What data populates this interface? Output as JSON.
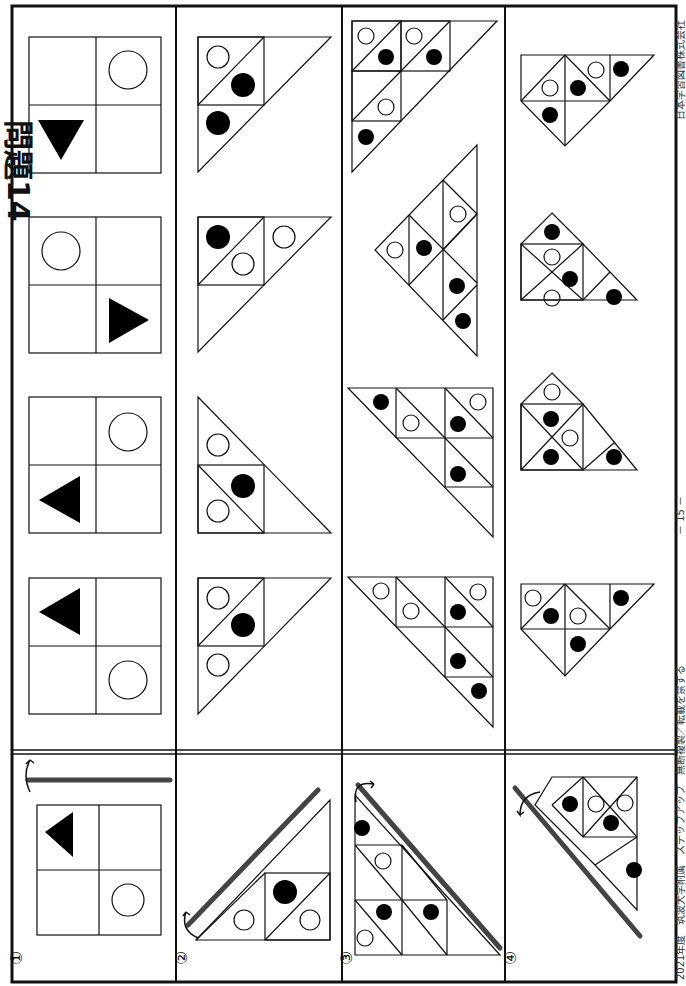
{
  "page": {
    "title": "問題14",
    "page_number": "－ 15 －",
    "footer_left": "2021年度　筑波大学附属　ステップアップ　無断複製／転載を禁ずる",
    "footer_right": "日本学習図書株式会社"
  },
  "questions": [
    {
      "number": "①",
      "type": "square-grid-flip",
      "fold_line": "horizontal bar above figure, flip arrow",
      "figure": "2x2 grid: filled triangle top-left pointing left, empty circle bottom-right",
      "options": [
        "2x2 grid: circle bottom-right(rotated view), filled triangle top-left",
        "2x2 grid: filled triangle, circle",
        "2x2 grid: circle, filled triangle pointing right",
        "2x2 grid: filled triangle pointing down, circle"
      ]
    },
    {
      "number": "②",
      "type": "triangle-flip",
      "fold_line": "diagonal bar, flip arrow",
      "figure": "right triangle with square of two triangles; filled dot and two empty circles",
      "options": [
        "option 1",
        "option 2",
        "option 3",
        "option 4"
      ]
    },
    {
      "number": "③",
      "type": "triangle-flip",
      "fold_line": "diagonal bar, flip arrow",
      "figure": "large right triangle subdivided; 3 filled dots, 3 empty circles",
      "options": [
        "option 1",
        "option 2",
        "option 3",
        "option 4"
      ]
    },
    {
      "number": "④",
      "type": "shape-flip",
      "fold_line": "diagonal bar, flip arrow",
      "figure": "composite triangle shape; 3 filled dots, 2 empty circles",
      "options": [
        "option 1",
        "option 2",
        "option 3",
        "option 4"
      ]
    }
  ],
  "colors": {
    "line": "#111111",
    "fold_bar": "#444444",
    "fill": "#000000",
    "background": "#ffffff"
  }
}
